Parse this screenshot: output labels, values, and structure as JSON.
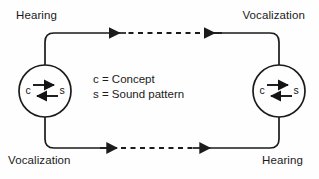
{
  "diagram": {
    "type": "cycle-diagram",
    "background_color": "#fefefe",
    "stroke_color": "#1b1b1b",
    "labels": {
      "top_left": "Hearing",
      "top_right": "Vocalization",
      "bottom_left": "Vocalization",
      "bottom_right": "Hearing"
    },
    "legend": {
      "line1": "c = Concept",
      "line2": "s = Sound pattern"
    },
    "nodes": [
      {
        "id": "left-node",
        "letter_left": "c",
        "letter_right": "s",
        "center_x": 45,
        "center_y": 91,
        "radius": 26,
        "arrow_top_direction": "right",
        "arrow_bottom_direction": "left"
      },
      {
        "id": "right-node",
        "letter_left": "c",
        "letter_right": "s",
        "center_x": 279,
        "center_y": 91,
        "radius": 26,
        "arrow_top_direction": "right",
        "arrow_bottom_direction": "left"
      }
    ],
    "paths": [
      {
        "id": "top-path",
        "direction": "right-to-left",
        "style": "solid-dashed-solid",
        "arrowheads": 2
      },
      {
        "id": "bottom-path",
        "direction": "left-to-right",
        "style": "solid-dashed-solid",
        "arrowheads": 2
      }
    ]
  }
}
